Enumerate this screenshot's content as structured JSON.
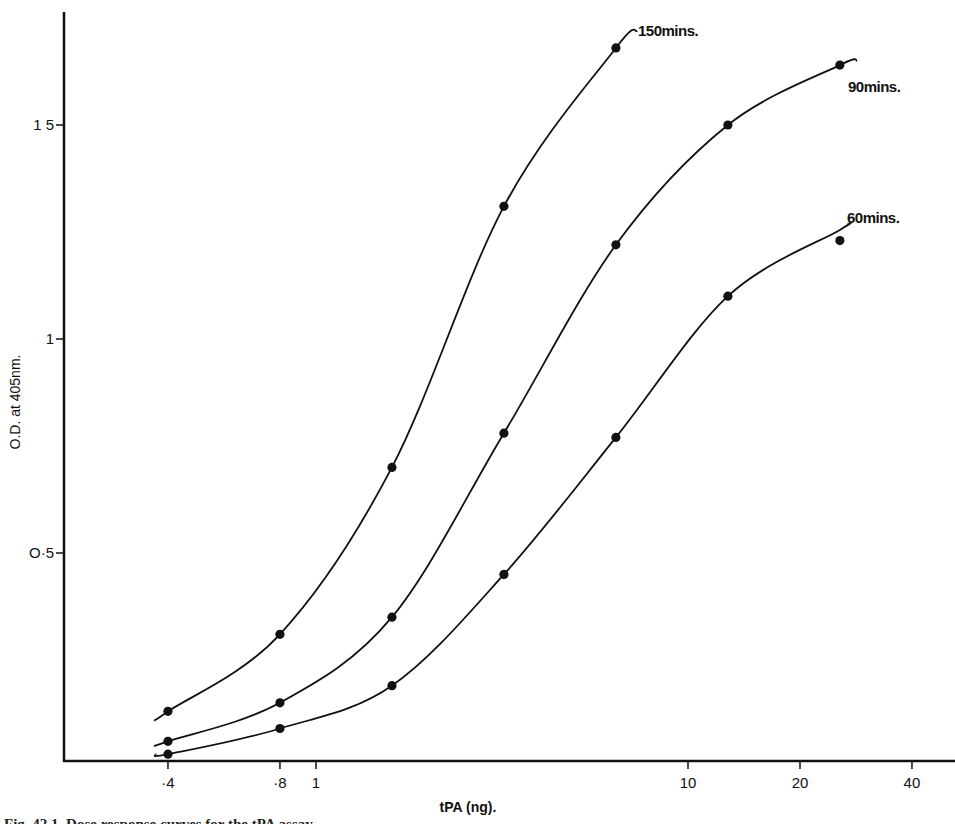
{
  "chart_data": {
    "type": "line",
    "title": "",
    "xlabel": "tPA (ng).",
    "ylabel": "O.D. at 405nm.",
    "xscale": "log",
    "xlim": [
      0.26,
      48
    ],
    "ylim": [
      0.0,
      1.75
    ],
    "grid": false,
    "legend": "inline labels at curve ends",
    "x_ticks": [
      {
        "value": 0.4,
        "label": "·4"
      },
      {
        "value": 0.8,
        "label": "·8"
      },
      {
        "value": 1,
        "label": "1"
      },
      {
        "value": 10,
        "label": "10"
      },
      {
        "value": 20,
        "label": "20"
      },
      {
        "value": 40,
        "label": "40"
      }
    ],
    "y_ticks": [
      {
        "value": 0.5,
        "label": "O·5"
      },
      {
        "value": 1.0,
        "label": "1"
      },
      {
        "value": 1.5,
        "label": "1 5"
      }
    ],
    "series": [
      {
        "name": "150mins.",
        "x": [
          0.4,
          0.8,
          1.6,
          3.2,
          6.4
        ],
        "values": [
          0.13,
          0.31,
          0.7,
          1.31,
          1.68
        ],
        "curve_start": [
          0.37,
          0.11
        ],
        "curve_end": [
          7.3,
          1.72
        ]
      },
      {
        "name": "90mins.",
        "x": [
          0.4,
          0.8,
          1.6,
          3.2,
          6.4,
          12.8,
          25.6
        ],
        "values": [
          0.06,
          0.15,
          0.35,
          0.78,
          1.22,
          1.5,
          1.64
        ],
        "curve_start": [
          0.37,
          0.05
        ],
        "curve_end": [
          28.5,
          1.65
        ]
      },
      {
        "name": "60mins.",
        "x": [
          0.4,
          0.8,
          1.6,
          3.2,
          6.4,
          12.8,
          25.6
        ],
        "values": [
          0.03,
          0.09,
          0.19,
          0.45,
          0.77,
          1.1,
          1.23
        ],
        "curve_start": [
          0.37,
          0.03
        ],
        "curve_end": [
          27.0,
          1.27
        ]
      }
    ],
    "annotations": [
      "150mins.",
      "90mins.",
      "60mins."
    ]
  },
  "caption": {
    "text": "Fig. 42.1.  Dose response curves for the tPA assay ..."
  }
}
